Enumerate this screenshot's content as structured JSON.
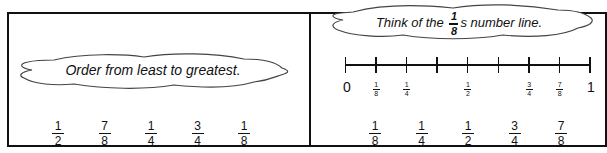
{
  "left_panel": {
    "prompt": "Order from least to greatest.",
    "fractions": [
      {
        "num": "1",
        "den": "2"
      },
      {
        "num": "7",
        "den": "8"
      },
      {
        "num": "1",
        "den": "4"
      },
      {
        "num": "3",
        "den": "4"
      },
      {
        "num": "1",
        "den": "8"
      }
    ]
  },
  "right_panel": {
    "prompt_before": "Think of the",
    "prompt_frac": {
      "num": "1",
      "den": "8"
    },
    "prompt_after": "s number line.",
    "number_line": {
      "start_label": "0",
      "end_label": "1",
      "tick_count": 9,
      "labels": [
        {
          "pos": 1,
          "num": "1",
          "den": "8"
        },
        {
          "pos": 2,
          "num": "1",
          "den": "4"
        },
        {
          "pos": 4,
          "num": "1",
          "den": "2"
        },
        {
          "pos": 6,
          "num": "3",
          "den": "4"
        },
        {
          "pos": 7,
          "num": "7",
          "den": "8"
        }
      ]
    },
    "answer": [
      {
        "num": "1",
        "den": "8"
      },
      {
        "num": "1",
        "den": "4"
      },
      {
        "num": "1",
        "den": "2"
      },
      {
        "num": "3",
        "den": "4"
      },
      {
        "num": "7",
        "den": "8"
      }
    ]
  }
}
